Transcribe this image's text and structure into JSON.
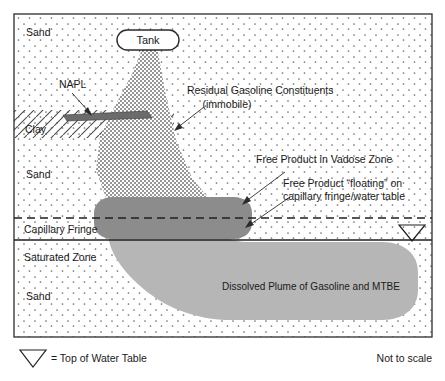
{
  "figure": {
    "title_present": false,
    "frame": {
      "stroke": "#2b2b2b"
    },
    "colors": {
      "background": "#ffffff",
      "sand_dot": "#6e6e6e",
      "clay_hatch": "#4a4a4a",
      "napl_lens": "#6b6b6b",
      "residual_plume": "#7a7a7a",
      "free_product_lens": "#8c8c8c",
      "dissolved_plume": "#b6b6b6",
      "line": "#2b2b2b",
      "text": "#1a1a1a"
    }
  },
  "strata": [
    {
      "id": "sand-upper",
      "label": "Sand"
    },
    {
      "id": "clay",
      "label": "Clay"
    },
    {
      "id": "sand-middle",
      "label": "Sand"
    },
    {
      "id": "capillary-fringe",
      "label": "Capillary Fringe"
    },
    {
      "id": "saturated-zone",
      "label": "Saturated Zone"
    },
    {
      "id": "sand-lower",
      "label": "Sand"
    }
  ],
  "features": {
    "tank": {
      "label": "Tank"
    },
    "napl": {
      "label": "NAPL"
    },
    "residual": {
      "line1": "Residual Gasoline Constituents",
      "line2": "(immobile)"
    },
    "free_product_vadose": {
      "label": "Free Product in Vadose Zone"
    },
    "free_product_floating": {
      "line1": "Free Product “floating” on",
      "line2": "capillary fringe/water table"
    },
    "dissolved_plume": {
      "label": "Dissolved Plume of Gasoline and MTBE"
    }
  },
  "legend": {
    "water_table_symbol": "water-table-triangle-icon",
    "water_table_text": "= Top of Water Table",
    "scale_note": "Not to scale"
  }
}
